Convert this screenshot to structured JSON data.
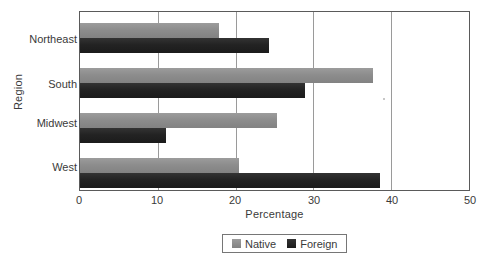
{
  "chart_data": {
    "type": "bar",
    "orientation": "horizontal",
    "title": "",
    "xlabel": "Percentage",
    "ylabel": "Region",
    "categories": [
      "Northeast",
      "South",
      "Midwest",
      "West"
    ],
    "series": [
      {
        "name": "Native",
        "color": "#8d8d8d",
        "values": [
          17.9,
          37.6,
          25.3,
          20.5
        ]
      },
      {
        "name": "Foreign",
        "color": "#232323",
        "values": [
          24.3,
          28.9,
          11.0,
          38.6
        ]
      }
    ],
    "xlim": [
      0,
      50
    ],
    "xticks": [
      0,
      10,
      20,
      30,
      40,
      50
    ],
    "xtick_labels": [
      "0",
      "10",
      "20",
      "30",
      "40",
      "50"
    ],
    "grid": "vertical",
    "legend_position": "bottom-center",
    "legend_entries": [
      "Native",
      "Foreign"
    ]
  },
  "axes": {
    "x_title": "Percentage",
    "y_title": "Region"
  },
  "legend": {
    "native_label": "Native",
    "foreign_label": "Foreign"
  },
  "ticks": {
    "x": [
      "0",
      "10",
      "20",
      "30",
      "40",
      "50"
    ],
    "y": [
      "Northeast",
      "South",
      "Midwest",
      "West"
    ]
  }
}
